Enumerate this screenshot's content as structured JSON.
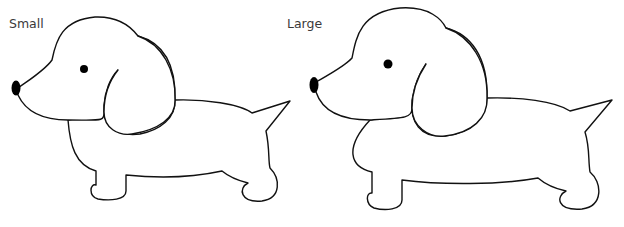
{
  "panels": [
    {
      "label": "Small",
      "size": "small"
    },
    {
      "label": "Large",
      "size": "large"
    }
  ],
  "figure": {
    "icons": [
      "dog-outline-small",
      "dog-outline-large"
    ]
  }
}
